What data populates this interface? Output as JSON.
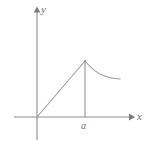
{
  "figure": {
    "kind": "cartesian-axes-plot",
    "background_color": "#ffffff",
    "line_color": "#9a9a9a",
    "label_color": "#6e6e6e",
    "labels": {
      "y_axis": "y",
      "x_axis": "x",
      "x_tick": "a"
    },
    "axes": {
      "origin_px": [
        37,
        117
      ],
      "y_axis_from_px": [
        37,
        140
      ],
      "y_axis_to_px": [
        37,
        8
      ],
      "x_axis_from_px": [
        14,
        117
      ],
      "x_axis_to_px": [
        133,
        117
      ],
      "y_arrow_tip_px": [
        37,
        7
      ],
      "x_arrow_tip_px": [
        134,
        117
      ]
    },
    "plot": {
      "description": "piecewise curve: straight segment rising from origin to peak at x = a, then decaying curve to the right",
      "peak_px": [
        85,
        61
      ],
      "rising_segment_px": [
        [
          37,
          117
        ],
        [
          85,
          61
        ]
      ],
      "decay_points_px": [
        [
          85,
          61
        ],
        [
          91,
          66
        ],
        [
          97,
          71
        ],
        [
          103,
          74.5
        ],
        [
          109,
          77
        ],
        [
          114,
          78.3
        ],
        [
          120,
          79
        ]
      ],
      "drop_line_px": [
        [
          85,
          61
        ],
        [
          85,
          117
        ]
      ]
    }
  }
}
